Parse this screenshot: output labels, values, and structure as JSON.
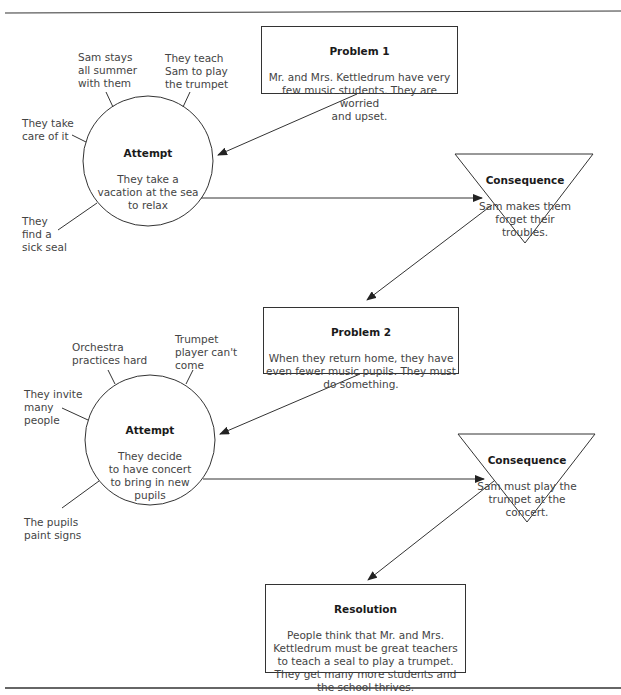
{
  "story_map": {
    "section1": {
      "problem": {
        "title": "Problem 1",
        "text": "Mr. and Mrs. Kettledrum have very\nfew music students. They are worried\nand upset."
      },
      "attempt": {
        "title": "Attempt",
        "text": "They take a\nvacation at the sea\nto relax"
      },
      "details": [
        {
          "text": "Sam stays\nall summer\nwith them"
        },
        {
          "text": "They teach\nSam to play\nthe trumpet"
        },
        {
          "text": "They take\ncare of it"
        },
        {
          "text": "They\nfind a\nsick seal"
        }
      ],
      "consequence": {
        "title": "Consequence",
        "text": "Sam makes them\nforget their\ntroubles."
      }
    },
    "section2": {
      "problem": {
        "title": "Problem 2",
        "text": "When they return home, they have\neven fewer music pupils. They must\ndo something."
      },
      "attempt": {
        "title": "Attempt",
        "text": "They decide\nto have concert\nto bring in new\npupils"
      },
      "details": [
        {
          "text": "Orchestra\npractices hard"
        },
        {
          "text": "Trumpet\nplayer can't\ncome"
        },
        {
          "text": "They invite\nmany\npeople"
        },
        {
          "text": "The pupils\npaint signs"
        }
      ],
      "consequence": {
        "title": "Consequence",
        "text": "Sam must play the\ntrumpet at the\nconcert."
      }
    },
    "resolution": {
      "title": "Resolution",
      "text": "People think that Mr. and Mrs.\nKettledrum must be great teachers\nto teach a seal to play a trumpet.\nThey get many more students and\nthe school thrives."
    }
  },
  "colors": {
    "line": "#333333",
    "text": "#444444",
    "title": "#1a1a1a"
  }
}
